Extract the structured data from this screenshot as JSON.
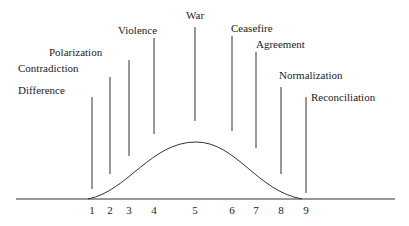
{
  "chart_data": {
    "type": "line",
    "title": "",
    "xlabel": "",
    "ylabel": "",
    "stages": [
      {
        "n": "1",
        "label": "Difference",
        "x": 92,
        "label_x": 18,
        "label_y": 94,
        "line_top": 97,
        "line_bottom": 189
      },
      {
        "n": "2",
        "label": "Contradiction",
        "x": 110,
        "label_x": 18,
        "label_y": 72,
        "line_top": 77,
        "line_bottom": 174
      },
      {
        "n": "3",
        "label": "Polarization",
        "x": 129,
        "label_x": 49,
        "label_y": 56,
        "line_top": 60,
        "line_bottom": 156
      },
      {
        "n": "4",
        "label": "Violence",
        "x": 154,
        "label_x": 118,
        "label_y": 34,
        "line_top": 38,
        "line_bottom": 134
      },
      {
        "n": "5",
        "label": "War",
        "x": 195,
        "label_x": 186,
        "label_y": 19,
        "line_top": 27,
        "line_bottom": 121
      },
      {
        "n": "6",
        "label": "Ceasefire",
        "x": 232,
        "label_x": 231,
        "label_y": 32,
        "line_top": 36,
        "line_bottom": 131
      },
      {
        "n": "7",
        "label": "Agreement",
        "x": 256,
        "label_x": 256,
        "label_y": 48,
        "line_top": 52,
        "line_bottom": 148
      },
      {
        "n": "8",
        "label": "Normalization",
        "x": 281,
        "label_x": 279,
        "label_y": 79,
        "line_top": 87,
        "line_bottom": 174
      },
      {
        "n": "9",
        "label": "Reconciliation",
        "x": 306,
        "label_x": 311,
        "label_y": 101,
        "line_top": 97,
        "line_bottom": 193
      }
    ],
    "axis": {
      "x_start": 16,
      "x_end": 395,
      "y": 199
    },
    "curve": {
      "start_x": 88,
      "peak_x": 196,
      "peak_y": 142,
      "end_x": 302
    }
  }
}
